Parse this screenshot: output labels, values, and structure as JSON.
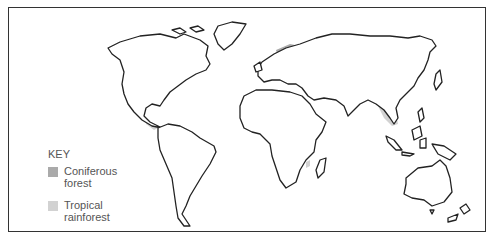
{
  "map": {
    "type": "world-map",
    "key": {
      "title": "KEY",
      "items": [
        {
          "label_line1": "Coniferous",
          "label_line2": "forest",
          "color": "#aaaaaa"
        },
        {
          "label_line1": "Tropical",
          "label_line2": "rainforest",
          "color": "#d2d2d2"
        }
      ]
    },
    "regions": [
      {
        "name": "Coniferous forest",
        "areas": [
          "North America (Canada/Alaska)",
          "Northern Europe",
          "Siberia"
        ]
      },
      {
        "name": "Tropical rainforest",
        "areas": [
          "Central America",
          "Amazon basin",
          "Congo basin",
          "Madagascar",
          "Southeast Asia",
          "New Guinea"
        ]
      }
    ],
    "colors": {
      "outline": "#222222",
      "coniferous": "#aaaaaa",
      "tropical": "#d2d2d2",
      "background": "#ffffff"
    }
  }
}
